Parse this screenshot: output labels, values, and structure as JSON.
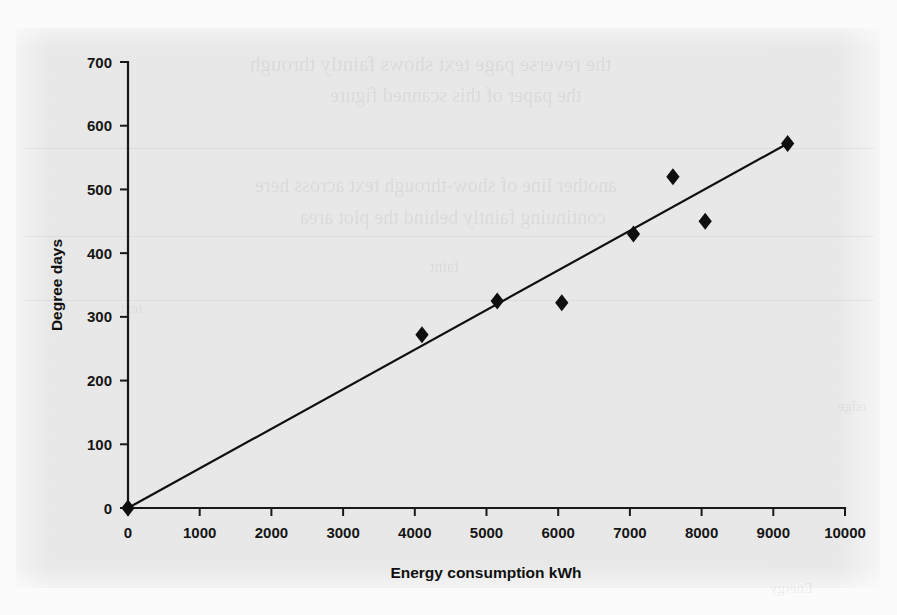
{
  "figure": {
    "kind": "scatter-with-trendline",
    "background_color": "#eaeaea",
    "page_color": "#fdfdfd",
    "ink_color": "#111111",
    "scan_artifact": "faint mirrored show-through text from the reverse side of the scanned page"
  },
  "chart_data": {
    "type": "scatter",
    "title": "",
    "subtitle": "",
    "xlabel": "Energy consumption kWh",
    "ylabel": "Degree days",
    "xlim": [
      0,
      10000
    ],
    "ylim": [
      0,
      700
    ],
    "xticks": [
      0,
      1000,
      2000,
      3000,
      4000,
      5000,
      6000,
      7000,
      8000,
      9000,
      10000
    ],
    "yticks": [
      0,
      100,
      200,
      300,
      400,
      500,
      600,
      700
    ],
    "xtick_labels": [
      "0",
      "1000",
      "2000",
      "3000",
      "4000",
      "5000",
      "6000",
      "7000",
      "8000",
      "9000",
      "10000"
    ],
    "ytick_labels": [
      "0",
      "100",
      "200",
      "300",
      "400",
      "500",
      "600",
      "700"
    ],
    "grid": false,
    "legend": false,
    "legend_position": "none",
    "marker_style": "filled-diamond",
    "marker_color": "#101010",
    "series": [
      {
        "name": "Degree days vs energy consumption",
        "points": [
          {
            "x": 0,
            "y": 0
          },
          {
            "x": 4100,
            "y": 272
          },
          {
            "x": 5150,
            "y": 325
          },
          {
            "x": 6050,
            "y": 322
          },
          {
            "x": 7050,
            "y": 430
          },
          {
            "x": 7600,
            "y": 520
          },
          {
            "x": 8050,
            "y": 450
          },
          {
            "x": 9200,
            "y": 572
          }
        ]
      }
    ],
    "trendline": {
      "name": "linear fit through origin",
      "type": "line",
      "x_start": 0,
      "y_start": 0,
      "x_end": 9200,
      "y_end": 572
    },
    "annotations": []
  },
  "bleed_through": {
    "note": "illegible mirrored text showing through the paper",
    "lines": [
      {
        "text": "the reverse page text shows faintly through",
        "x": 250,
        "y": 52,
        "size": 21
      },
      {
        "text": "the paper of this scanned figure",
        "x": 330,
        "y": 84,
        "size": 20
      },
      {
        "text": "another line of show-through text across here",
        "x": 255,
        "y": 174,
        "size": 20
      },
      {
        "text": "continuing faintly behind the plot area",
        "x": 300,
        "y": 206,
        "size": 20
      },
      {
        "text": "faint",
        "x": 430,
        "y": 258,
        "size": 16
      },
      {
        "text": "text",
        "x": 120,
        "y": 300,
        "size": 15
      },
      {
        "text": "edge",
        "x": 838,
        "y": 398,
        "size": 15
      },
      {
        "text": "Energy",
        "x": 770,
        "y": 580,
        "size": 15
      }
    ]
  }
}
